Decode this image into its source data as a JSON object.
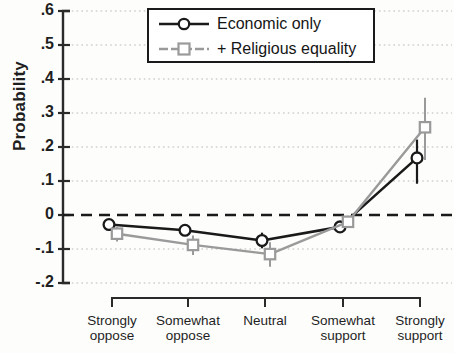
{
  "chart_data": {
    "type": "line",
    "title": "",
    "xlabel": "",
    "ylabel": "Probability",
    "ylim": [
      -0.2,
      0.6
    ],
    "yticks": [
      0.6,
      0.5,
      0.4,
      0.3,
      0.2,
      0.1,
      0,
      -0.1,
      -0.2
    ],
    "ytick_labels": [
      ".6",
      ".5",
      ".4",
      ".3",
      ".2",
      ".1",
      "0",
      "-.1",
      "-.2"
    ],
    "categories": [
      "Strongly\noppose",
      "Somewhat\noppose",
      "Neutral",
      "Somewhat\nsupport",
      "Strongly\nsupport"
    ],
    "grid": "horizontal-dotted",
    "zero_reference_line": 0,
    "legend_position": "top-center",
    "series": [
      {
        "name": "Economic only",
        "color": "#1a1a1a",
        "marker": "circle",
        "values": [
          -0.028,
          -0.045,
          -0.075,
          -0.035,
          0.168
        ],
        "err_low": [
          -0.038,
          -0.062,
          -0.098,
          -0.052,
          0.092
        ],
        "err_high": [
          -0.018,
          -0.028,
          -0.052,
          -0.018,
          0.222
        ]
      },
      {
        "name": "+ Religious equality",
        "color": "#9a9a9a",
        "marker": "square",
        "values": [
          -0.055,
          -0.088,
          -0.115,
          -0.02,
          0.258
        ],
        "err_low": [
          -0.078,
          -0.118,
          -0.152,
          -0.038,
          0.162
        ],
        "err_high": [
          -0.035,
          -0.06,
          -0.08,
          -0.002,
          0.345
        ]
      }
    ]
  },
  "legend": {
    "items": [
      {
        "label": "Economic only"
      },
      {
        "label": "+ Religious equality"
      }
    ]
  }
}
